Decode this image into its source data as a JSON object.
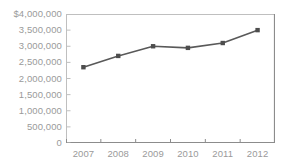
{
  "chart_data": {
    "type": "line",
    "title": "",
    "subtitle": "",
    "xlabel": "",
    "ylabel": "",
    "categories": [
      "2007",
      "2008",
      "2009",
      "2010",
      "2011",
      "2012"
    ],
    "series": [
      {
        "name": "",
        "values": [
          2350000,
          2700000,
          3000000,
          2950000,
          3100000,
          3500000
        ]
      }
    ],
    "ylim": [
      0,
      4000000
    ],
    "ytick_values": [
      4000000,
      3500000,
      3000000,
      2500000,
      2000000,
      1500000,
      1000000,
      500000,
      0
    ],
    "ytick_labels": [
      "$4,000,000",
      "3,500,000",
      "3,000,000",
      "2,500,000",
      "2,000,000",
      "1,500,000",
      "1,000,000",
      "500,000",
      "0"
    ],
    "xtick_labels": [
      "2007",
      "2008",
      "2009",
      "2010",
      "2011",
      "2012"
    ],
    "grid": false,
    "legend": false,
    "legend_position": "none",
    "annotations": [],
    "colors": {
      "line": "#595959",
      "marker": "#4d4d4d",
      "axis": "#bfbfbf",
      "tick_label": "#9a9a9a",
      "background": "#ffffff"
    },
    "marker_style": "square",
    "line_width": 1.6
  }
}
